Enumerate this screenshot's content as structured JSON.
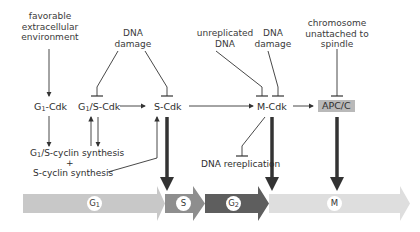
{
  "signals": {
    "favorable": "favorable\nextracellular\nenvironment",
    "dna_damage_1": "DNA\ndamage",
    "unreplicated": "unreplicated\nDNA",
    "dna_damage_2": "DNA\ndamage",
    "chromosome": "chromosome\nunattached to\nspindle"
  },
  "nodes": {
    "g1_cdk": {
      "pre": "G",
      "sub": "1",
      "post": "-Cdk"
    },
    "g1s_cdk": {
      "pre": "G",
      "sub": "1",
      "post": "/S-Cdk"
    },
    "s_cdk": "S-Cdk",
    "m_cdk": "M-Cdk",
    "apc": "APC/C"
  },
  "synthesis": {
    "g1s": {
      "pre": "G",
      "sub": "1",
      "post": "/S-cyclin synthesis"
    },
    "plus": "+",
    "s_cyclin": "S-cyclin synthesis"
  },
  "dna_rereplication": "DNA rereplication",
  "phases": [
    {
      "name": "G",
      "sub": "1",
      "color": "#c8c8c8"
    },
    {
      "name": "S",
      "sub": "",
      "color": "#8e8e8e"
    },
    {
      "name": "G",
      "sub": "2",
      "color": "#5e5e5e"
    },
    {
      "name": "M",
      "sub": "",
      "color": "#dedede"
    }
  ],
  "colors": {
    "line": "#333333",
    "apc_fill": "#b9b9b9"
  }
}
